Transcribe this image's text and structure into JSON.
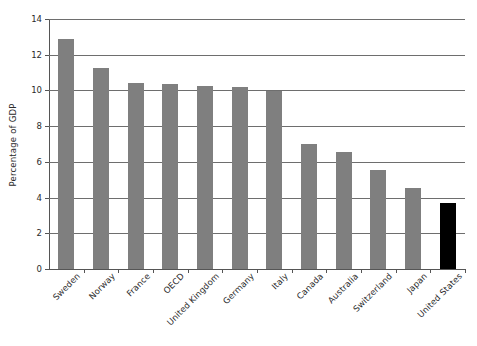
{
  "chart_data": {
    "type": "bar",
    "title": "",
    "xlabel": "",
    "ylabel": "Percentage of GDP",
    "ylim": [
      0,
      14
    ],
    "ytick_labels": [
      "0",
      "2",
      "4",
      "6",
      "8",
      "10",
      "12",
      "14"
    ],
    "ytick_values": [
      0,
      2,
      4,
      6,
      8,
      10,
      12,
      14
    ],
    "grid": "horizontal",
    "legend": "none",
    "categories": [
      "Sweden",
      "Norway",
      "France",
      "OECD",
      "United Kingdom",
      "Germany",
      "Italy",
      "Canada",
      "Australia",
      "Switzerland",
      "Japan",
      "United States"
    ],
    "values": [
      12.9,
      11.25,
      10.4,
      10.35,
      10.25,
      10.2,
      9.95,
      7.0,
      6.55,
      5.55,
      4.55,
      3.7
    ],
    "bar_colors": [
      "#7f7f7f",
      "#7f7f7f",
      "#7f7f7f",
      "#7f7f7f",
      "#7f7f7f",
      "#7f7f7f",
      "#7f7f7f",
      "#7f7f7f",
      "#7f7f7f",
      "#7f7f7f",
      "#7f7f7f",
      "#000000"
    ],
    "highlighted_category": "United States",
    "colors": {
      "bar_default": "#7f7f7f",
      "bar_highlight": "#000000",
      "gridline": "#6e6e6e",
      "axis": "#555555",
      "text": "#2b2b2b",
      "background": "#ffffff"
    }
  }
}
